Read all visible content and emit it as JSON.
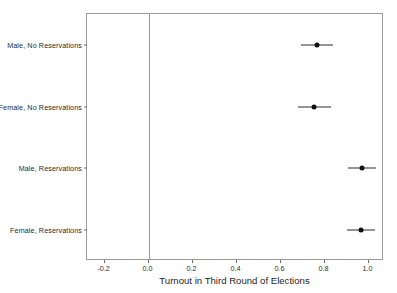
{
  "chart_data": {
    "type": "scatter",
    "title": "",
    "xlabel": "Turnout in Third Round of Elections",
    "ylabel": "",
    "xlim": [
      -0.28,
      1.07
    ],
    "xticks": [
      -0.2,
      0.0,
      0.2,
      0.4,
      0.6,
      0.8,
      1.0
    ],
    "xticklabels": [
      "-0.2",
      "0.0",
      "0.2",
      "0.4",
      "0.6",
      "0.8",
      "1.0"
    ],
    "grid": false,
    "legend": null,
    "orientation": "horizontal",
    "reference_line": {
      "x": 0.0,
      "color": "#9a9a9a"
    },
    "categories": [
      "Male, No Reservations",
      "Female, No Reservations",
      "Male, Reservations",
      "Female, Reservations"
    ],
    "points": [
      {
        "label": "Male, No Reservations",
        "estimate": 0.765,
        "ci_low": 0.692,
        "ci_high": 0.838
      },
      {
        "label": "Female, No Reservations",
        "estimate": 0.75,
        "ci_low": 0.678,
        "ci_high": 0.828
      },
      {
        "label": "Male, Reservations",
        "estimate": 0.968,
        "ci_low": 0.905,
        "ci_high": 1.032
      },
      {
        "label": "Female, Reservations",
        "estimate": 0.964,
        "ci_low": 0.9,
        "ci_high": 1.028
      }
    ],
    "marker": {
      "shape": "circle",
      "color": "#111111"
    },
    "errorbar_color": "#2d2d2d"
  }
}
